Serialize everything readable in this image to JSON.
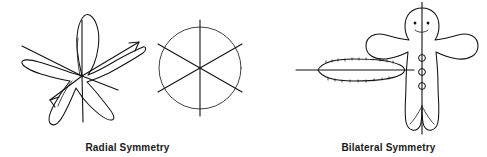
{
  "figure": {
    "title_visible": false,
    "background_color": "#ffffff",
    "ink_color": "#111111",
    "panels": [
      {
        "id": "radial",
        "caption": "Radial Symmetry",
        "organisms": [
          {
            "name": "starfish",
            "shape": "five-armed sea star",
            "symmetry_lines": 5,
            "line_style": "arrowed radii from center"
          },
          {
            "name": "circle-diagram",
            "shape": "circle",
            "symmetry_lines": 3,
            "radii": 6,
            "line_style": "diameters at 60 degree intervals"
          }
        ]
      },
      {
        "id": "bilateral",
        "caption": "Bilateral Symmetry",
        "organisms": [
          {
            "name": "worm",
            "shape": "elongated oval body",
            "symmetry_lines": 1,
            "line_style": "horizontal midline through long axis"
          },
          {
            "name": "human-figure",
            "shape": "gingerbread-style person with head, two arms, two legs",
            "symmetry_lines": 1,
            "line_style": "vertical midline through body",
            "features": [
              "two eyes",
              "smiling mouth",
              "three buttons"
            ]
          }
        ]
      }
    ]
  }
}
